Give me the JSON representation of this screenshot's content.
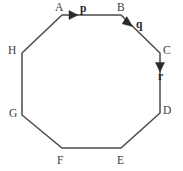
{
  "figure": {
    "background_color": "#ffffff",
    "stroke_color": "#4a4a4a",
    "stroke_width": 1.5,
    "label_color": "#3d3d3d",
    "vector_label_color": "#262626",
    "width": 183,
    "height": 171
  },
  "shape": {
    "name": "octagon",
    "sides": 8,
    "closed": true,
    "path": "M 62 15 L 121 15 L 160 53 L 160 113 L 121 148 L 62 148 L 22 115 L 22 53 Z",
    "vertices": [
      {
        "id": "A",
        "label": "A",
        "x": 62,
        "y": 15,
        "label_x": 55,
        "label_y": 2
      },
      {
        "id": "B",
        "label": "B",
        "x": 121,
        "y": 15,
        "label_x": 117,
        "label_y": 2
      },
      {
        "id": "C",
        "label": "C",
        "x": 160,
        "y": 53,
        "label_x": 163,
        "label_y": 45
      },
      {
        "id": "D",
        "label": "D",
        "x": 160,
        "y": 113,
        "label_x": 163,
        "label_y": 105
      },
      {
        "id": "E",
        "label": "E",
        "x": 121,
        "y": 148,
        "label_x": 117,
        "label_y": 155
      },
      {
        "id": "F",
        "label": "F",
        "x": 62,
        "y": 148,
        "label_x": 57,
        "label_y": 155
      },
      {
        "id": "G",
        "label": "G",
        "x": 22,
        "y": 115,
        "label_x": 9,
        "label_y": 108
      },
      {
        "id": "H",
        "label": "H",
        "x": 22,
        "y": 53,
        "label_x": 8,
        "label_y": 45
      }
    ]
  },
  "vectors": [
    {
      "id": "p",
      "label": "p",
      "from": "A",
      "to": "B",
      "direction": "right",
      "arrow_tip_x": 78,
      "arrow_tip_y": 15,
      "label_x": 80,
      "label_y": 3
    },
    {
      "id": "q",
      "label": "q",
      "from": "B",
      "to": "C",
      "direction": "down-right",
      "arrow_tip_x": 132,
      "arrow_tip_y": 26,
      "label_x": 136,
      "label_y": 19
    },
    {
      "id": "r",
      "label": "r",
      "from": "C",
      "to": "D",
      "direction": "down",
      "arrow_tip_x": 160,
      "arrow_tip_y": 72,
      "label_x": 158,
      "label_y": 71
    }
  ]
}
